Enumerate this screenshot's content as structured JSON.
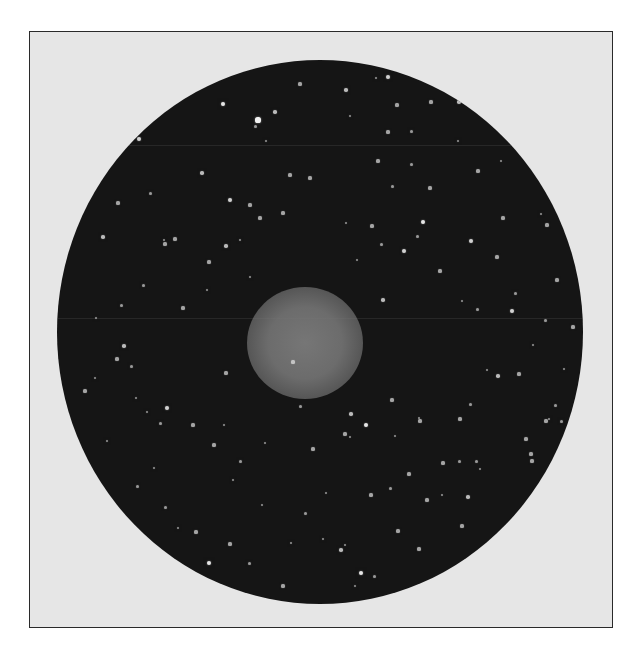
{
  "image": {
    "description": "Astronomical telescope photograph of a planetary nebula in a circular star field",
    "colors": {
      "page_background": "#ffffff",
      "frame_background": "#e6e6e6",
      "frame_border": "#2a2a2a",
      "sky": "#151515",
      "nebula": "#6c6c6c",
      "star": "#f2f2f2"
    },
    "frame": {
      "x": 29,
      "y": 31,
      "width": 584,
      "height": 597
    },
    "field": {
      "cx": 320,
      "cy": 332,
      "rx": 263,
      "ry": 272
    },
    "nebula": {
      "cx": 305,
      "cy": 343,
      "rx": 58,
      "ry": 56
    },
    "scanlines_y": [
      145,
      318
    ],
    "stars": [
      [
        223,
        104,
        2.2
      ],
      [
        258,
        120,
        2.6
      ],
      [
        275,
        112,
        1.8
      ],
      [
        300,
        84,
        1.6
      ],
      [
        346,
        90,
        1.8
      ],
      [
        388,
        77,
        2.0
      ],
      [
        376,
        78,
        1.4
      ],
      [
        397,
        105,
        1.6
      ],
      [
        431,
        102,
        1.6
      ],
      [
        459,
        102,
        1.8
      ],
      [
        255,
        126,
        1.5
      ],
      [
        139,
        139,
        2.0
      ],
      [
        266,
        141,
        1.4
      ],
      [
        290,
        175,
        1.6
      ],
      [
        310,
        178,
        1.6
      ],
      [
        202,
        173,
        1.8
      ],
      [
        230,
        200,
        2.0
      ],
      [
        250,
        205,
        1.6
      ],
      [
        260,
        218,
        1.6
      ],
      [
        150,
        193,
        1.5
      ],
      [
        118,
        203,
        1.6
      ],
      [
        103,
        237,
        1.8
      ],
      [
        165,
        244,
        1.6
      ],
      [
        164,
        240,
        1.4
      ],
      [
        175,
        239,
        1.6
      ],
      [
        226,
        246,
        1.8
      ],
      [
        240,
        240,
        1.4
      ],
      [
        283,
        213,
        1.6
      ],
      [
        250,
        277,
        1.4
      ],
      [
        183,
        308,
        1.6
      ],
      [
        117,
        359,
        1.6
      ],
      [
        131,
        366,
        1.5
      ],
      [
        226,
        373,
        1.6
      ],
      [
        350,
        116,
        1.4
      ],
      [
        388,
        132,
        1.6
      ],
      [
        411,
        131,
        1.5
      ],
      [
        378,
        161,
        1.6
      ],
      [
        411,
        164,
        1.5
      ],
      [
        430,
        188,
        1.6
      ],
      [
        458,
        141,
        1.4
      ],
      [
        478,
        171,
        1.6
      ],
      [
        501,
        161,
        1.4
      ],
      [
        503,
        218,
        1.6
      ],
      [
        346,
        223,
        1.4
      ],
      [
        372,
        226,
        1.6
      ],
      [
        423,
        222,
        2.2
      ],
      [
        417,
        236,
        1.5
      ],
      [
        381,
        244,
        1.5
      ],
      [
        404,
        251,
        2.0
      ],
      [
        471,
        241,
        2.0
      ],
      [
        497,
        257,
        1.6
      ],
      [
        547,
        225,
        1.6
      ],
      [
        541,
        214,
        1.4
      ],
      [
        440,
        271,
        1.6
      ],
      [
        557,
        280,
        1.6
      ],
      [
        383,
        300,
        1.8
      ],
      [
        512,
        311,
        2.0
      ],
      [
        573,
        327,
        1.6
      ],
      [
        545,
        320,
        1.5
      ],
      [
        85,
        391,
        1.6
      ],
      [
        95,
        378,
        1.4
      ],
      [
        147,
        412,
        1.4
      ],
      [
        167,
        408,
        2.0
      ],
      [
        193,
        425,
        1.6
      ],
      [
        160,
        423,
        1.5
      ],
      [
        124,
        346,
        1.8
      ],
      [
        136,
        398,
        1.4
      ],
      [
        214,
        445,
        1.6
      ],
      [
        224,
        425,
        1.4
      ],
      [
        240,
        461,
        1.5
      ],
      [
        265,
        443,
        1.4
      ],
      [
        293,
        362,
        1.6
      ],
      [
        300,
        406,
        1.5
      ],
      [
        313,
        449,
        1.6
      ],
      [
        345,
        434,
        1.6
      ],
      [
        351,
        414,
        1.8
      ],
      [
        366,
        425,
        2.2
      ],
      [
        350,
        437,
        1.4
      ],
      [
        392,
        400,
        1.6
      ],
      [
        395,
        436,
        1.4
      ],
      [
        420,
        421,
        1.6
      ],
      [
        419,
        418,
        1.4
      ],
      [
        443,
        463,
        1.6
      ],
      [
        459,
        461,
        1.5
      ],
      [
        460,
        419,
        1.6
      ],
      [
        487,
        370,
        1.4
      ],
      [
        498,
        376,
        1.8
      ],
      [
        519,
        374,
        1.6
      ],
      [
        533,
        345,
        1.4
      ],
      [
        546,
        421,
        1.6
      ],
      [
        549,
        419,
        1.4
      ],
      [
        526,
        439,
        1.6
      ],
      [
        561,
        421,
        1.5
      ],
      [
        532,
        461,
        1.6
      ],
      [
        555,
        405,
        1.5
      ],
      [
        476,
        461,
        1.5
      ],
      [
        480,
        469,
        1.4
      ],
      [
        371,
        495,
        1.6
      ],
      [
        390,
        488,
        1.5
      ],
      [
        409,
        474,
        1.6
      ],
      [
        427,
        500,
        1.6
      ],
      [
        442,
        495,
        1.4
      ],
      [
        468,
        497,
        1.8
      ],
      [
        531,
        454,
        1.6
      ],
      [
        398,
        531,
        1.6
      ],
      [
        341,
        550,
        1.8
      ],
      [
        345,
        545,
        1.4
      ],
      [
        361,
        573,
        2.2
      ],
      [
        355,
        586,
        1.4
      ],
      [
        374,
        576,
        1.5
      ],
      [
        419,
        549,
        1.6
      ],
      [
        462,
        526,
        1.6
      ],
      [
        485,
        552,
        1.6
      ],
      [
        507,
        557,
        1.8
      ],
      [
        515,
        530,
        1.6
      ],
      [
        540,
        554,
        1.4
      ],
      [
        551,
        511,
        1.4
      ],
      [
        209,
        563,
        2.2
      ],
      [
        249,
        563,
        1.5
      ],
      [
        283,
        586,
        1.6
      ],
      [
        291,
        543,
        1.4
      ],
      [
        323,
        539,
        1.4
      ],
      [
        410,
        591,
        1.4
      ],
      [
        196,
        532,
        1.6
      ],
      [
        165,
        507,
        1.5
      ],
      [
        178,
        528,
        1.4
      ],
      [
        137,
        486,
        1.5
      ],
      [
        154,
        468,
        1.4
      ],
      [
        230,
        544,
        1.6
      ],
      [
        107,
        441,
        1.4
      ],
      [
        262,
        505,
        1.4
      ],
      [
        305,
        513,
        1.5
      ],
      [
        233,
        480,
        1.4
      ],
      [
        121,
        305,
        1.5
      ],
      [
        96,
        318,
        1.4
      ],
      [
        143,
        285,
        1.5
      ],
      [
        207,
        290,
        1.4
      ],
      [
        209,
        262,
        1.6
      ],
      [
        357,
        260,
        1.4
      ],
      [
        392,
        186,
        1.5
      ],
      [
        462,
        301,
        1.4
      ],
      [
        477,
        309,
        1.5
      ],
      [
        515,
        293,
        1.5
      ],
      [
        564,
        369,
        1.4
      ],
      [
        470,
        404,
        1.5
      ],
      [
        326,
        493,
        1.4
      ]
    ]
  }
}
